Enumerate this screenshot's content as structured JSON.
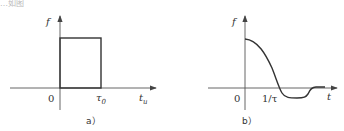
{
  "top_fragment": "…如图",
  "panels": [
    {
      "id": "a",
      "caption": "a）",
      "y_axis_label": "f",
      "x_axis_label": "t",
      "x_axis_label_sub": "u",
      "origin_label": "0",
      "tick_label": "τ",
      "tick_label_sub": "0",
      "shape": "rectangular pulse from 0 to τ0"
    },
    {
      "id": "b",
      "caption": "b）",
      "y_axis_label": "f",
      "x_axis_label": "t",
      "origin_label": "0",
      "tick_label": "1/τ",
      "shape": "sinc-like decaying curve crossing zero near 1/τ"
    }
  ],
  "colors": {
    "line": "#333333",
    "axis": "#555555",
    "background": "#ffffff"
  }
}
